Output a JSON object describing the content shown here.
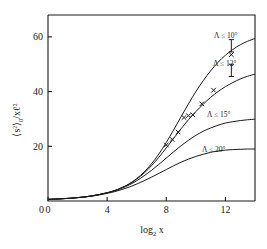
{
  "figure": {
    "background": "#ffffff",
    "line_color": "#1a1a1a",
    "marker_symbol": "x"
  },
  "chart_data": {
    "type": "line",
    "title": "",
    "subtitle": "",
    "xlabel": "log₂ x",
    "ylabel": "⟨s²⟩₀ / x ℓ²",
    "xlim": [
      0,
      14
    ],
    "ylim": [
      0,
      68
    ],
    "xticks": [
      0,
      4,
      8,
      12
    ],
    "xticklabels": [
      "0",
      "4",
      "8",
      "12"
    ],
    "yticks": [
      20,
      40,
      60
    ],
    "yticklabels": [
      "20",
      "40",
      "60"
    ],
    "grid": false,
    "legend_position": "inline-right",
    "series": [
      {
        "name": "Λ ≤ 10°",
        "label": "Λ ≤ 10°",
        "plateau": 60,
        "x": [
          0,
          0.5,
          1,
          1.5,
          2,
          2.5,
          3,
          3.5,
          4,
          4.5,
          5,
          5.5,
          6,
          6.5,
          7,
          7.5,
          8,
          8.5,
          9,
          9.5,
          10,
          10.5,
          11,
          11.5,
          12,
          12.5,
          13,
          13.5,
          14
        ],
        "y": [
          0.6,
          0.7,
          0.85,
          1.0,
          1.25,
          1.5,
          1.9,
          2.4,
          3.0,
          3.8,
          4.9,
          6.3,
          8.2,
          10.6,
          13.6,
          17.2,
          21.4,
          26.0,
          30.8,
          35.5,
          40.0,
          44.0,
          47.6,
          50.7,
          53.3,
          55.4,
          57.1,
          58.4,
          59.4
        ]
      },
      {
        "name": "Λ ≤ 12°",
        "label": "Λ ≤ 12°",
        "plateau": 48,
        "x": [
          0,
          0.5,
          1,
          1.5,
          2,
          2.5,
          3,
          3.5,
          4,
          4.5,
          5,
          5.5,
          6,
          6.5,
          7,
          7.5,
          8,
          8.5,
          9,
          9.5,
          10,
          10.5,
          11,
          11.5,
          12,
          12.5,
          13,
          13.5,
          14
        ],
        "y": [
          0.6,
          0.7,
          0.85,
          1.0,
          1.25,
          1.5,
          1.9,
          2.4,
          3.0,
          3.8,
          4.9,
          6.2,
          8.0,
          10.2,
          12.9,
          16.0,
          19.4,
          22.9,
          26.4,
          29.7,
          32.7,
          35.4,
          37.9,
          40.0,
          41.8,
          43.3,
          44.6,
          45.6,
          46.4
        ]
      },
      {
        "name": "Λ ≤ 15°",
        "label": "Λ ≤ 15°",
        "plateau": 30,
        "x": [
          0,
          0.5,
          1,
          1.5,
          2,
          2.5,
          3,
          3.5,
          4,
          4.5,
          5,
          5.5,
          6,
          6.5,
          7,
          7.5,
          8,
          8.5,
          9,
          9.5,
          10,
          10.5,
          11,
          11.5,
          12,
          12.5,
          13,
          13.5,
          14
        ],
        "y": [
          0.6,
          0.7,
          0.85,
          1.0,
          1.25,
          1.5,
          1.9,
          2.4,
          3.0,
          3.7,
          4.7,
          5.9,
          7.4,
          9.2,
          11.2,
          13.4,
          15.7,
          18.0,
          20.2,
          22.2,
          24.0,
          25.5,
          26.7,
          27.7,
          28.5,
          29.0,
          29.4,
          29.7,
          29.9
        ]
      },
      {
        "name": "Λ ≤ 20°",
        "label": "Λ ≤ 20°",
        "plateau": 19,
        "x": [
          0,
          0.5,
          1,
          1.5,
          2,
          2.5,
          3,
          3.5,
          4,
          4.5,
          5,
          5.5,
          6,
          6.5,
          7,
          7.5,
          8,
          8.5,
          9,
          9.5,
          10,
          10.5,
          11,
          11.5,
          12,
          12.5,
          13,
          13.5,
          14
        ],
        "y": [
          0.6,
          0.7,
          0.85,
          1.0,
          1.2,
          1.45,
          1.8,
          2.25,
          2.8,
          3.4,
          4.2,
          5.1,
          6.2,
          7.4,
          8.7,
          10.1,
          11.5,
          12.9,
          14.2,
          15.3,
          16.3,
          17.1,
          17.8,
          18.3,
          18.6,
          18.8,
          18.9,
          19.0,
          19.0
        ]
      }
    ],
    "data_points": {
      "name": "measured points",
      "marker": "x",
      "x": [
        8.0,
        8.4,
        8.8,
        9.2,
        9.5,
        9.8,
        10.4,
        11.2,
        12.4
      ],
      "y": [
        20.5,
        22.5,
        25.2,
        30.5,
        31.2,
        31.5,
        35.5,
        40.5,
        53.5
      ]
    },
    "error_bars": [
      {
        "x": 12.4,
        "y_low": 54.5,
        "y_high": 59.0
      },
      {
        "x": 12.4,
        "y_low": 45.5,
        "y_high": 50.0
      }
    ]
  }
}
